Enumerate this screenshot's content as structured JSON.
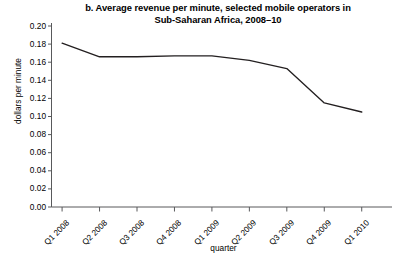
{
  "figure": {
    "title_lines": [
      "b. Average revenue per minute, selected mobile operators in",
      "Sub-Saharan Africa, 2008–10"
    ],
    "background_color": "#ffffff",
    "line_color": "#231f20",
    "axis_color": "#58595b",
    "text_color": "#000000"
  },
  "chart_data": {
    "type": "line",
    "title": "b. Average revenue per minute, selected mobile operators in Sub-Saharan Africa, 2008–10",
    "xlabel": "quarter",
    "ylabel": "dollars per minute",
    "categories": [
      "Q1 2008",
      "Q2 2008",
      "Q3 2008",
      "Q4 2008",
      "Q1 2009",
      "Q2 2009",
      "Q3 2009",
      "Q4 2009",
      "Q1 2010"
    ],
    "values": [
      0.181,
      0.166,
      0.166,
      0.167,
      0.167,
      0.162,
      0.153,
      0.115,
      0.105
    ],
    "series": [
      {
        "name": "Average revenue per minute",
        "values": [
          0.181,
          0.166,
          0.166,
          0.167,
          0.167,
          0.162,
          0.153,
          0.115,
          0.105
        ]
      }
    ],
    "ylim": [
      0.0,
      0.2
    ],
    "ytick_values": [
      0.0,
      0.02,
      0.04,
      0.06,
      0.08,
      0.1,
      0.12,
      0.14,
      0.16,
      0.18,
      0.2
    ],
    "ytick_labels": [
      "0.00",
      "0.02",
      "0.04",
      "0.06",
      "0.08",
      "0.10",
      "0.12",
      "0.14",
      "0.16",
      "0.18",
      "0.20"
    ],
    "grid": false,
    "legend": "none",
    "markers": "none"
  }
}
